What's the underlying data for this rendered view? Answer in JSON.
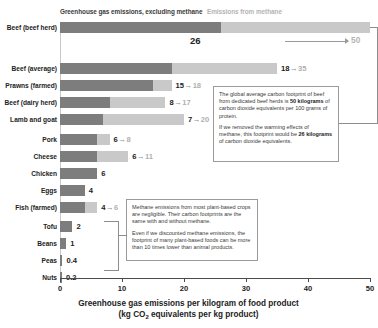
{
  "legend": {
    "dark_label": "Greenhouse gas emissions, excluding methane",
    "light_label": "Emissions from methane"
  },
  "axis": {
    "title_line1": "Greenhouse gas emissions per kilogram of food product",
    "title_line2_pre": "(kg CO",
    "title_line2_sub": "2",
    "title_line2_post": " equivalents per kg product)",
    "ticks": [
      "0",
      "10",
      "20",
      "30",
      "40",
      "50"
    ]
  },
  "callouts": {
    "beef": {
      "p1_a": "The global average carbon footprint of beef from dedicated beef herds is ",
      "p1_b": "50 kilograms",
      "p1_c": " of carbon dioxide equivalents per 100 grams of protein.",
      "p2_a": "If we removed the warming effects of methane, this footprint would be ",
      "p2_b": "26 kilograms",
      "p2_c": " of carbon dioxide equivalents."
    },
    "plant": {
      "p1": "Methane emissions from most plant-based crops are negligible. Their carbon footprints are the same with and without methane.",
      "p2": "Even if we discounted methane emissions, the footprint of many plant-based foods can be more than 10 times lower than animal products."
    }
  },
  "highlight": {
    "big_value": "26",
    "arrow_value": "50"
  },
  "chart_data": {
    "type": "bar",
    "orientation": "horizontal",
    "stacked": true,
    "title": "Greenhouse gas emissions per kilogram of food product",
    "xlabel": "kg CO2 equivalents per kg product",
    "ylabel": "",
    "xlim": [
      0,
      50
    ],
    "grid": false,
    "legend_position": "top",
    "series": [
      {
        "name": "Greenhouse gas emissions, excluding methane",
        "color": "#7d7d7d",
        "values": [
          26,
          18,
          15,
          8,
          7,
          6,
          6,
          6,
          4,
          4,
          2,
          1,
          0.4,
          0.2
        ]
      },
      {
        "name": "Emissions from methane",
        "color": "#c9c9c9",
        "values": [
          24,
          17,
          3,
          9,
          13,
          2,
          5,
          0,
          0,
          2,
          0,
          0,
          0,
          0
        ]
      }
    ],
    "categories": [
      "Beef (beef herd)",
      "Beef (average)",
      "Prawns (farmed)",
      "Beef (dairy herd)",
      "Lamb and goat",
      "Pork",
      "Cheese",
      "Chicken",
      "Eggs",
      "Fish (farmed)",
      "Tofu",
      "Beans",
      "Peas",
      "Nuts"
    ],
    "rows": [
      {
        "label": "Beef (beef herd)",
        "excl": 26,
        "total": 50,
        "label_excl": "26",
        "label_total": "50",
        "label_mode": "highlight"
      },
      {
        "label": "Beef (average)",
        "excl": 18,
        "total": 35,
        "label_excl": "18",
        "label_total": "35",
        "label_mode": "pair"
      },
      {
        "label": "Prawns (farmed)",
        "excl": 15,
        "total": 18,
        "label_excl": "15",
        "label_total": "18",
        "label_mode": "pair"
      },
      {
        "label": "Beef (dairy herd)",
        "excl": 8,
        "total": 17,
        "label_excl": "8",
        "label_total": "17",
        "label_mode": "pair"
      },
      {
        "label": "Lamb and goat",
        "excl": 7,
        "total": 20,
        "label_excl": "7",
        "label_total": "20",
        "label_mode": "pair"
      },
      {
        "label": "Pork",
        "excl": 6,
        "total": 8,
        "label_excl": "6",
        "label_total": "8",
        "label_mode": "pair"
      },
      {
        "label": "Cheese",
        "excl": 6,
        "total": 11,
        "label_excl": "6",
        "label_total": "11",
        "label_mode": "pair"
      },
      {
        "label": "Chicken",
        "excl": 6,
        "total": 6,
        "label_excl": "6",
        "label_total": "",
        "label_mode": "single"
      },
      {
        "label": "Eggs",
        "excl": 4,
        "total": 4,
        "label_excl": "4",
        "label_total": "",
        "label_mode": "single"
      },
      {
        "label": "Fish (farmed)",
        "excl": 4,
        "total": 6,
        "label_excl": "4",
        "label_total": "6",
        "label_mode": "pair"
      },
      {
        "label": "Tofu",
        "excl": 2,
        "total": 2,
        "label_excl": "2",
        "label_total": "",
        "label_mode": "single"
      },
      {
        "label": "Beans",
        "excl": 1,
        "total": 1,
        "label_excl": "1",
        "label_total": "",
        "label_mode": "single"
      },
      {
        "label": "Peas",
        "excl": 0.4,
        "total": 0.4,
        "label_excl": "0.4",
        "label_total": "",
        "label_mode": "single"
      },
      {
        "label": "Nuts",
        "excl": 0.2,
        "total": 0.2,
        "label_excl": "0.2",
        "label_total": "",
        "label_mode": "single"
      }
    ]
  }
}
